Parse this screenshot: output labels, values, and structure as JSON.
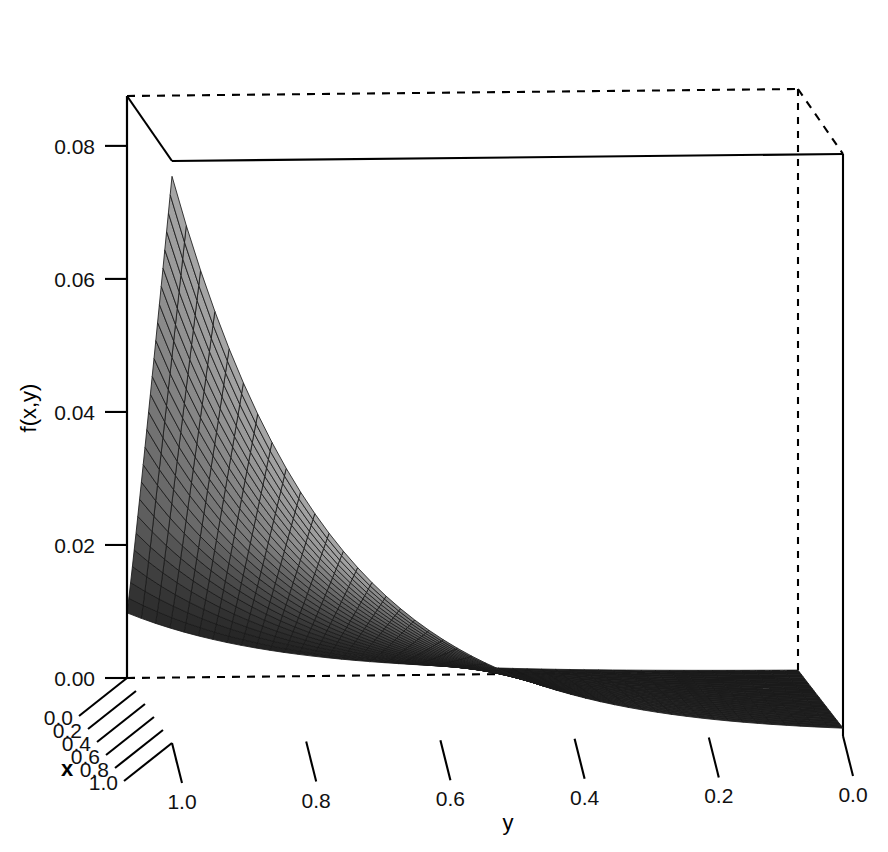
{
  "chart_data": {
    "type": "surface3d",
    "title": "",
    "subtitle": "",
    "xlabel": "x",
    "ylabel": "y",
    "zlabel": "f(x,y)",
    "xticks": [
      "1.0",
      "0.8",
      "0.6",
      "0.4",
      "0.2",
      "0.0"
    ],
    "xtick_values": [
      1.0,
      0.8,
      0.6,
      0.4,
      0.2,
      0.0
    ],
    "yticks": [
      "1.0",
      "0.8",
      "0.6",
      "0.4",
      "0.2",
      "0.0"
    ],
    "ytick_values": [
      1.0,
      0.8,
      0.6,
      0.4,
      0.2,
      0.0
    ],
    "zticks": [
      "0.00",
      "0.02",
      "0.04",
      "0.06",
      "0.08"
    ],
    "ztick_values": [
      0.0,
      0.02,
      0.04,
      0.06,
      0.08
    ],
    "xlim": [
      0.0,
      1.0
    ],
    "ylim": [
      0.0,
      1.0
    ],
    "zlim": [
      0.0,
      0.0875
    ],
    "grid": false,
    "legend": "none",
    "render": "wireframe-shaded",
    "surface_color_light": "#d8d8d8",
    "surface_color_dark": "#1a1a1a",
    "line_color": "#1a1a1a",
    "box_color": "#000000",
    "background": "#ffffff",
    "x_axis_direction": "0.0 at front-left to 1.0 at front-right-near",
    "y_axis_direction": "1.0 at left to 0.0 at right",
    "z_values_grid": {
      "y": [
        1.0,
        0.9,
        0.8,
        0.7,
        0.6,
        0.5,
        0.4,
        0.3,
        0.2,
        0.1,
        0.0
      ],
      "series": [
        {
          "name": "x=1.0",
          "values": [
            0.085,
            0.0555,
            0.0362,
            0.0236,
            0.0154,
            0.01,
            0.0065,
            0.0043,
            0.0028,
            0.0018,
            0.0012
          ]
        },
        {
          "name": "x=0.8",
          "values": [
            0.076,
            0.0497,
            0.0324,
            0.0211,
            0.0138,
            0.009,
            0.0059,
            0.0038,
            0.0025,
            0.0016,
            0.0011
          ]
        },
        {
          "name": "x=0.6",
          "values": [
            0.064,
            0.0418,
            0.0273,
            0.0178,
            0.0116,
            0.0076,
            0.0049,
            0.0032,
            0.0021,
            0.0014,
            0.0009
          ]
        },
        {
          "name": "x=0.4",
          "values": [
            0.049,
            0.032,
            0.0209,
            0.0136,
            0.0089,
            0.0058,
            0.0038,
            0.0025,
            0.0016,
            0.001,
            0.0007
          ]
        },
        {
          "name": "x=0.2",
          "values": [
            0.031,
            0.0203,
            0.0132,
            0.0086,
            0.0056,
            0.0037,
            0.0024,
            0.0016,
            0.001,
            0.0007,
            0.0004
          ]
        },
        {
          "name": "x=0.0",
          "values": [
            0.01,
            0.0065,
            0.0043,
            0.0028,
            0.0018,
            0.0012,
            0.0008,
            0.0005,
            0.0003,
            0.0002,
            0.0001
          ]
        }
      ]
    }
  }
}
